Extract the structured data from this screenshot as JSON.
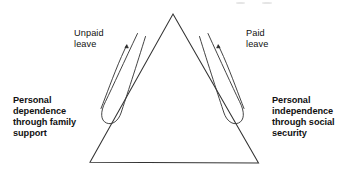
{
  "figure": {
    "type": "diagram",
    "title": "",
    "background_color": "#ffffff",
    "stroke_color": "#2b2b2b",
    "text_color": "#111111",
    "shapes": {
      "triangle": {
        "name": "triangle",
        "apex": [
          173,
          14
        ],
        "bottom_left": [
          90,
          162
        ],
        "bottom_right": [
          258,
          163
        ]
      },
      "left_hairpin": {
        "name": "left-hairpin-curve",
        "description": "narrow U-turn loop on the lower-left inside of the triangle"
      },
      "right_hairpin": {
        "name": "right-hairpin-curve",
        "description": "narrow U-turn loop on the lower-right inside of the triangle"
      },
      "left_arrow": {
        "name": "left-arrow",
        "direction": "up-left",
        "points_to": "Unpaid leave"
      },
      "right_arrow": {
        "name": "right-arrow",
        "direction": "up-right",
        "points_to": "Paid leave"
      }
    },
    "labels": {
      "unpaid_leave": "Unpaid\nleave",
      "paid_leave": "Paid\nleave",
      "personal_dependence": "Personal\ndependence\nthrough family\nsupport",
      "personal_independence": "Personal\nindependence\nthrough social\nsecurity"
    }
  }
}
